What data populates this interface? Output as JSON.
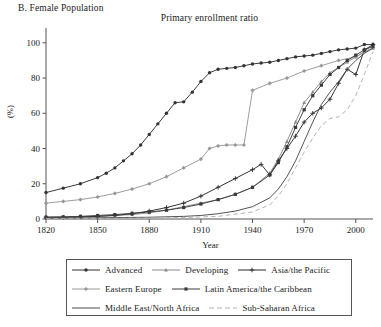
{
  "panel": {
    "label": "B. Female Population"
  },
  "chart_data": {
    "type": "line",
    "title": "Primary enrollment ratio",
    "xlabel": "Year",
    "ylabel": "(%)",
    "xlim": [
      1820,
      2010
    ],
    "ylim": [
      0,
      105
    ],
    "xticks": [
      1820,
      1850,
      1880,
      1910,
      1940,
      1970,
      2000
    ],
    "yticks": [
      0,
      20,
      40,
      60,
      80,
      100
    ],
    "grid": false,
    "legend_position": "below",
    "series": [
      {
        "name": "Advanced",
        "color": "#333333",
        "marker": "circle",
        "dash": "none",
        "x": [
          1820,
          1830,
          1840,
          1850,
          1855,
          1860,
          1865,
          1870,
          1875,
          1880,
          1885,
          1890,
          1895,
          1900,
          1905,
          1910,
          1915,
          1920,
          1925,
          1930,
          1935,
          1940,
          1945,
          1950,
          1955,
          1960,
          1965,
          1970,
          1975,
          1980,
          1985,
          1990,
          1995,
          2000,
          2005,
          2010
        ],
        "y": [
          15,
          17.5,
          20,
          23.5,
          26,
          29,
          33,
          37,
          42,
          48,
          54,
          60,
          66,
          66.5,
          72,
          78,
          83,
          85,
          85.5,
          86,
          87,
          88,
          88.5,
          89,
          90,
          91,
          92,
          92.5,
          93,
          94,
          95,
          96,
          96.5,
          97,
          99,
          99
        ]
      },
      {
        "name": "Developing",
        "color": "#8a8a8a",
        "marker": "triangle",
        "dash": "none",
        "x": [
          1820,
          1830,
          1840,
          1850,
          1860,
          1870,
          1880,
          1890,
          1900,
          1910,
          1920,
          1930,
          1940,
          1950,
          1955,
          1960,
          1965,
          1970,
          1975,
          1980,
          1985,
          1990,
          1995,
          2000,
          2005,
          2010
        ],
        "y": [
          1,
          1,
          1.2,
          1.5,
          2,
          2.5,
          3.5,
          5,
          7,
          9,
          11,
          14,
          18,
          26,
          34,
          44,
          55,
          66,
          72,
          78,
          83,
          86,
          89,
          92,
          95,
          97
        ]
      },
      {
        "name": "Asia/the Pacific",
        "color": "#2b2b2b",
        "marker": "plus",
        "dash": "none",
        "x": [
          1820,
          1830,
          1840,
          1850,
          1860,
          1870,
          1880,
          1890,
          1900,
          1910,
          1920,
          1930,
          1940,
          1945,
          1950,
          1955,
          1960,
          1965,
          1970,
          1975,
          1980,
          1985,
          1990,
          1995,
          2000,
          2005,
          2010
        ],
        "y": [
          1,
          1,
          1.2,
          1.5,
          2,
          3,
          4.5,
          6.5,
          9,
          13,
          18,
          23,
          28,
          31,
          25,
          33,
          40,
          47,
          55,
          60,
          63,
          68,
          77,
          85,
          82,
          96,
          99
        ]
      },
      {
        "name": "Eastern Europe",
        "color": "#999999",
        "marker": "diamond",
        "dash": "none",
        "x": [
          1820,
          1830,
          1840,
          1850,
          1860,
          1870,
          1880,
          1890,
          1900,
          1910,
          1915,
          1920,
          1925,
          1930,
          1935,
          1940,
          1950,
          1960,
          1970,
          1980,
          1990,
          2000,
          2010
        ],
        "y": [
          9,
          10,
          11,
          12.5,
          14.5,
          17,
          20,
          24,
          29,
          34,
          40,
          41.5,
          42,
          42,
          42,
          73,
          77,
          80,
          84,
          87,
          90,
          92,
          97
        ]
      },
      {
        "name": "Latin America/the Caribbean",
        "color": "#3a3a3a",
        "marker": "square",
        "dash": "none",
        "x": [
          1820,
          1830,
          1840,
          1850,
          1860,
          1870,
          1880,
          1890,
          1900,
          1910,
          1920,
          1930,
          1940,
          1950,
          1955,
          1960,
          1965,
          1970,
          1975,
          1980,
          1985,
          1990,
          1995,
          2000,
          2005,
          2010
        ],
        "y": [
          1,
          1.2,
          1.5,
          2,
          2.5,
          3.2,
          4,
          5,
          6.5,
          8.5,
          11,
          14,
          18,
          25,
          32,
          41,
          52,
          62,
          70,
          76,
          82,
          86,
          90,
          93,
          96,
          98
        ]
      },
      {
        "name": "Middle East/North Africa",
        "color": "#4a4a4a",
        "marker": "none",
        "dash": "none",
        "x": [
          1820,
          1840,
          1860,
          1880,
          1900,
          1910,
          1920,
          1930,
          1940,
          1950,
          1955,
          1960,
          1965,
          1970,
          1975,
          1980,
          1985,
          1990,
          1995,
          2000,
          2005,
          2010
        ],
        "y": [
          0.5,
          0.6,
          0.8,
          1,
          1.5,
          2,
          3,
          4.5,
          7,
          12,
          17,
          24,
          33,
          44,
          55,
          65,
          72,
          78,
          85,
          90,
          94,
          97
        ]
      },
      {
        "name": "Sub-Saharan Africa",
        "color": "#b0b0b0",
        "marker": "none",
        "dash": "dashed",
        "x": [
          1820,
          1860,
          1900,
          1920,
          1940,
          1950,
          1955,
          1960,
          1965,
          1970,
          1975,
          1980,
          1985,
          1990,
          1995,
          2000,
          2005,
          2010
        ],
        "y": [
          0.3,
          0.4,
          0.8,
          1.5,
          4,
          8,
          13,
          20,
          29,
          38,
          46,
          53,
          57,
          58,
          62,
          70,
          82,
          95
        ]
      }
    ]
  },
  "legend": {
    "rows": [
      [
        {
          "label": "Advanced",
          "marker": "circle",
          "color": "#333333",
          "dash": "none"
        },
        {
          "label": "Developing",
          "marker": "triangle",
          "color": "#8a8a8a",
          "dash": "none"
        },
        {
          "label": "Asia/the Pacific",
          "marker": "plus",
          "color": "#2b2b2b",
          "dash": "none"
        }
      ],
      [
        {
          "label": "Eastern Europe",
          "marker": "diamond",
          "color": "#999999",
          "dash": "none"
        },
        {
          "label": "Latin America/the Caribbean",
          "marker": "square",
          "color": "#3a3a3a",
          "dash": "none"
        }
      ],
      [
        {
          "label": "Middle East/North Africa",
          "marker": "none",
          "color": "#4a4a4a",
          "dash": "none"
        },
        {
          "label": "Sub-Saharan Africa",
          "marker": "none",
          "color": "#b0b0b0",
          "dash": "dashed"
        }
      ]
    ]
  }
}
